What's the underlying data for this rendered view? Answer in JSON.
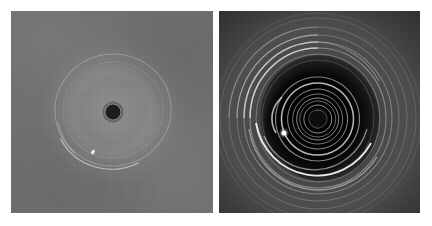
{
  "figure": {
    "background_color": "#ffffff",
    "width": 432,
    "height": 226,
    "panel_count": 2,
    "layout": "side-by-side",
    "caption": ""
  },
  "panels": [
    {
      "id": "panel-left",
      "label": "left-panel",
      "description": "Low-contrast uniform mid-gray field with a faint broad halo, one thin bright circular ring and a dark occulting disk at the centre",
      "x": 11,
      "y": 11,
      "width": 202,
      "height": 202,
      "background_color": "#6f6f6f",
      "contrast": "low",
      "features": {
        "central_disk": {
          "name": "dark-occulting-disk",
          "cx": 113,
          "cy": 112,
          "r": 7,
          "color": "#1d1d1d"
        },
        "halo": {
          "name": "faint-halo",
          "cx": 113,
          "cy": 112,
          "r": 75
        },
        "ring": {
          "name": "thin-bright-ring",
          "cx": 113,
          "cy": 110,
          "rx": 59,
          "ry": 57,
          "rotation_deg": -8
        },
        "bright_knot": {
          "name": "bright-knot",
          "cx": 93,
          "cy": 152,
          "r": 2
        }
      }
    },
    {
      "id": "panel-right",
      "label": "right-panel",
      "description": "High-contrast stretched version of the same field showing a multi-turn spiral wake, dark cavity lobes and many concentric outer arcs",
      "x": 219,
      "y": 11,
      "width": 201,
      "height": 202,
      "background_color": "#3b3b3b",
      "contrast": "high",
      "features": {
        "central_disk": {
          "name": "dark-core",
          "cx": 318,
          "cy": 118,
          "r": 7,
          "color": "#0d0d0d"
        },
        "spiral": {
          "name": "spiral-wake",
          "cx": 318,
          "cy": 118,
          "turns": 4,
          "winding_direction": "counterclockwise"
        },
        "cavity": {
          "name": "dark-cavity-lobe",
          "cx": 318,
          "cy": 118,
          "rx": 59,
          "ry": 63
        },
        "bright_moonlet": {
          "name": "bright-moonlet",
          "cx": 284,
          "cy": 133,
          "r": 2.5,
          "color": "#ffffff"
        },
        "outer_arcs": {
          "name": "concentric-arcs",
          "count": 8,
          "radii_px": [
            56,
            62,
            68,
            74,
            81,
            89,
            98,
            103
          ]
        }
      }
    }
  ],
  "colors": {
    "page_background": "#ffffff",
    "left_panel_gray": "#6f6f6f",
    "right_panel_gray": "#3b3b3b",
    "dark_core": "#1d1d1d",
    "bright_feature": "#ffffff"
  }
}
